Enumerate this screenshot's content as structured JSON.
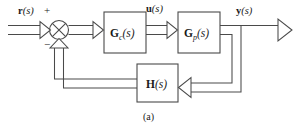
{
  "figure": {
    "caption": "(a)",
    "type": "control-system-block-diagram",
    "background_color": "#ffffff",
    "line_color": "#4a4a4a",
    "text_color": "#1a1a1a"
  },
  "signals": {
    "reference": {
      "name": "r",
      "arg": "(s)",
      "full": "r(s)"
    },
    "control": {
      "name": "u",
      "arg": "(s)",
      "full": "u(s)"
    },
    "output": {
      "name": "y",
      "arg": "(s)",
      "full": "y(s)"
    }
  },
  "summing_junction": {
    "name": "summing-junction",
    "glyph": "circle-with-x",
    "plus_sign": "+",
    "minus_sign": "−",
    "inputs": [
      "reference",
      "feedback"
    ],
    "outputs": [
      "error"
    ]
  },
  "blocks": [
    {
      "id": "controller",
      "name": "G",
      "subscript": "c",
      "arg": "(s)",
      "full": "Gc(s)",
      "role": "controller"
    },
    {
      "id": "plant",
      "name": "G",
      "subscript": "p",
      "arg": "(s)",
      "full": "Gp(s)",
      "role": "plant"
    },
    {
      "id": "feedback",
      "name": "H",
      "subscript": "",
      "arg": "(s)",
      "full": "H(s)",
      "role": "feedback-element"
    }
  ]
}
